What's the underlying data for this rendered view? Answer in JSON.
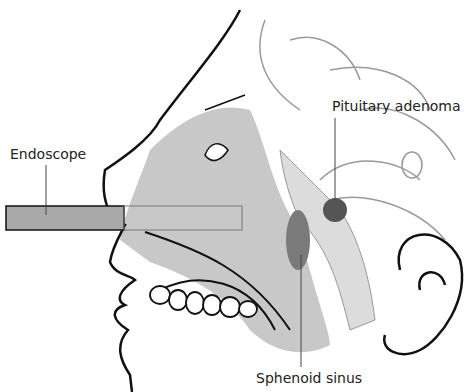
{
  "diagram": {
    "labels": {
      "endoscope": "Endoscope",
      "pituitary_adenoma": "Pituitary adenoma",
      "sphenoid_sinus": "Sphenoid sinus"
    },
    "colors": {
      "outline": "#111111",
      "fill_grey": "#c8c8c8",
      "endoscope_fill": "#a9a9a9",
      "brain_line": "#9a9a9a",
      "adenoma": "#555555",
      "sinus_dark": "#7a7a7a"
    }
  }
}
